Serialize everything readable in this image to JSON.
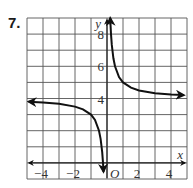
{
  "problem": {
    "number": "7."
  },
  "chart_data": {
    "type": "line",
    "title": "",
    "function": "y = 1/x + 4",
    "xlabel": "x",
    "ylabel": "y",
    "origin_label": "O",
    "xlim": [
      -5,
      5
    ],
    "ylim": [
      -1,
      9
    ],
    "grid": true,
    "x_ticks": [
      {
        "value": -4,
        "label": "−4"
      },
      {
        "value": -2,
        "label": "−2"
      },
      {
        "value": 2,
        "label": "2"
      },
      {
        "value": 4,
        "label": "4"
      }
    ],
    "y_ticks": [
      {
        "value": 8,
        "label": "8"
      },
      {
        "value": 6,
        "label": "6"
      },
      {
        "value": 4,
        "label": "4"
      }
    ],
    "asymptotes": {
      "vertical_x": 0,
      "horizontal_y": 4
    },
    "series": [
      {
        "name": "left-branch",
        "x": [
          -4.9,
          -4,
          -3,
          -2,
          -1.5,
          -1,
          -0.75,
          -0.5,
          -0.4,
          -0.3,
          -0.25,
          -0.22
        ],
        "y": [
          3.8,
          3.75,
          3.67,
          3.5,
          3.33,
          3.0,
          2.67,
          2.0,
          1.5,
          0.67,
          0.0,
          -0.55
        ]
      },
      {
        "name": "right-branch",
        "x": [
          0.2,
          0.25,
          0.3,
          0.4,
          0.5,
          0.75,
          1,
          1.5,
          2,
          3,
          4,
          4.8
        ],
        "y": [
          9.0,
          8.0,
          7.33,
          6.5,
          6.0,
          5.33,
          5.0,
          4.67,
          4.5,
          4.33,
          4.25,
          4.21
        ]
      }
    ],
    "colors": {
      "curve": "#111111",
      "grid": "#555555",
      "axis": "#222222"
    }
  }
}
